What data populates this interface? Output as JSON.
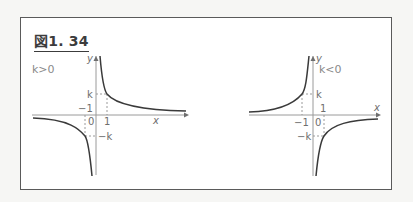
{
  "figure": {
    "title": "図1. 34",
    "panels": [
      {
        "case": "k>0",
        "axis_labels": {
          "x": "x",
          "y": "y"
        },
        "tick_labels": {
          "k": "k",
          "neg_k": "−k",
          "one": "1",
          "neg_one": "−1",
          "origin": "0"
        },
        "curve": "y = k/x, branches in quadrants I and III"
      },
      {
        "case": "k<0",
        "axis_labels": {
          "x": "x",
          "y": "y"
        },
        "tick_labels": {
          "k": "k",
          "neg_k": "−k",
          "one": "1",
          "neg_one": "−1",
          "origin": "0"
        },
        "curve": "y = k/x, branches in quadrants II and IV"
      }
    ]
  },
  "colors": {
    "frame": "#5a5a5a",
    "curve": "#3a3a3a",
    "axis": "#9a9a9a",
    "dashed": "#9a9a9a",
    "label": "#6e6e6e"
  }
}
